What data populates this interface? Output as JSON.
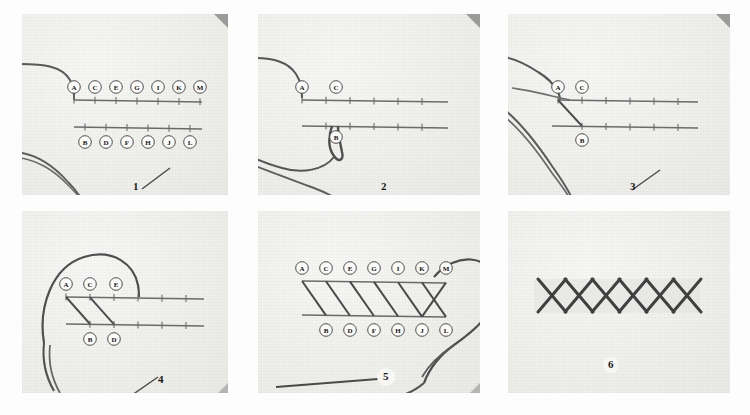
{
  "figure": {
    "panel_count": 6,
    "guide_points_top": [
      "A",
      "C",
      "E",
      "G",
      "I",
      "K",
      "M"
    ],
    "guide_points_bottom": [
      "B",
      "D",
      "F",
      "H",
      "J",
      "L"
    ],
    "colors": {
      "paper": "#f2f2f0",
      "thread": "#4a4a4a",
      "guideline": "#6e6e6e",
      "label_text": "#151515",
      "page_background": "#ffffff"
    }
  },
  "panels": [
    {
      "number": "1",
      "caption_number": "1",
      "top_labels": [
        "A",
        "C",
        "E",
        "G",
        "I",
        "K",
        "M"
      ],
      "bottom_labels": [
        "B",
        "D",
        "F",
        "H",
        "J",
        "L"
      ],
      "stitches": [],
      "has_needle": false,
      "has_thread_tail": true,
      "description": "Two parallel guide lines marked with alternating lettered points; thread laid alongside."
    },
    {
      "number": "2",
      "caption_number": "2",
      "top_labels": [
        "A",
        "C"
      ],
      "bottom_labels": [
        "B"
      ],
      "stitches": [],
      "has_needle": true,
      "has_thread_tail": true,
      "description": "Needle brought up at A and inserted down at B with loop of thread below."
    },
    {
      "number": "3",
      "caption_number": "3",
      "top_labels": [
        "A",
        "C"
      ],
      "bottom_labels": [
        "B"
      ],
      "stitches": [
        "A-B"
      ],
      "has_needle": false,
      "has_thread_tail": true,
      "description": "First diagonal stitch pulled from A down to B."
    },
    {
      "number": "4",
      "caption_number": "4",
      "top_labels": [
        "A",
        "C",
        "E"
      ],
      "bottom_labels": [
        "B",
        "D"
      ],
      "stitches": [
        "A-B",
        "C-D"
      ],
      "has_needle": false,
      "has_thread_tail": true,
      "description": "Two diagonal stitches formed A-B and C-D, thread carried to E."
    },
    {
      "number": "5",
      "caption_number": "5",
      "top_labels": [
        "A",
        "C",
        "E",
        "G",
        "I",
        "K",
        "M"
      ],
      "bottom_labels": [
        "B",
        "D",
        "F",
        "H",
        "J",
        "L"
      ],
      "stitches": [
        "A-B",
        "C-D",
        "E-F",
        "G-H",
        "I-J",
        "K-L",
        "M-crossing"
      ],
      "has_needle": true,
      "has_thread_tail": true,
      "description": "Completed row of slanted stitches with needle crossing back at M."
    },
    {
      "number": "6",
      "caption_number": "6",
      "top_labels": [],
      "bottom_labels": [],
      "stitches": [],
      "has_needle": false,
      "has_thread_tail": false,
      "description": "Finished herringbone band of interlocking crosses."
    }
  ]
}
